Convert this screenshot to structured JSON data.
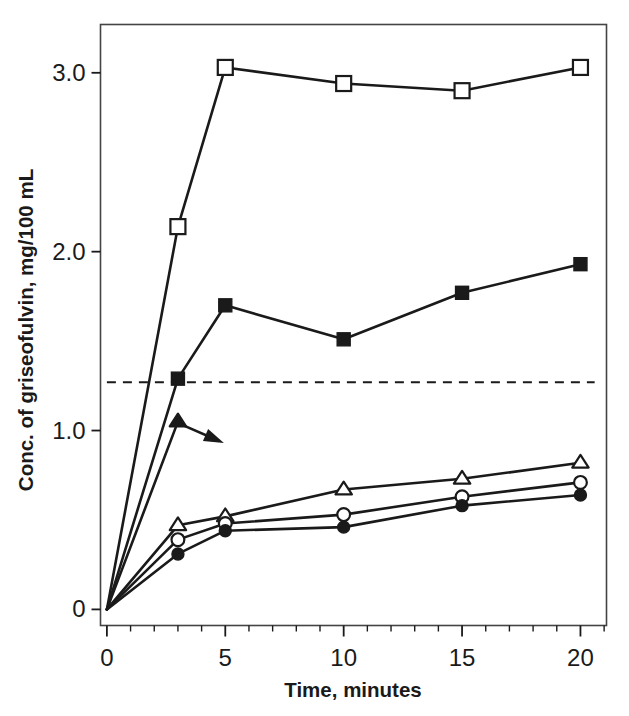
{
  "chart_data": {
    "type": "line",
    "title": "",
    "xlabel": "Time, minutes",
    "ylabel": "Conc. of griseofulvin, mg/100 mL",
    "x": [
      0,
      3,
      5,
      10,
      15,
      20
    ],
    "xlim": [
      -0.27,
      21.1
    ],
    "ylim": [
      -0.09,
      3.27
    ],
    "xticks": [
      0,
      5,
      10,
      15,
      20
    ],
    "xticklabels": [
      "0",
      "5",
      "10",
      "15",
      "20"
    ],
    "xminorticks": [
      1,
      2,
      3,
      4,
      6,
      7,
      8,
      9,
      11,
      12,
      13,
      14,
      16,
      17,
      18,
      19,
      21
    ],
    "yticks": [
      0,
      1.0,
      2.0,
      3.0
    ],
    "yticklabels": [
      "0",
      "1.0",
      "2.0",
      "3.0"
    ],
    "grid": false,
    "legend": "none",
    "frame": "box",
    "line_color": "#1a1a1a",
    "annotations": [
      {
        "kind": "arrow",
        "name": "triangle-series-arrow",
        "from_x": 3.0,
        "from_y": 1.05,
        "to_x": 5.0,
        "to_y": 0.93
      },
      {
        "kind": "dashed-horizontal-line",
        "name": "saturation-reference-line",
        "y": 1.27,
        "x_start": 0.0,
        "x_end": 20.6,
        "style": "dashed"
      }
    ],
    "series": [
      {
        "name": "open-square-series",
        "marker": "open-square",
        "x": [
          0,
          3,
          5,
          10,
          15,
          20
        ],
        "values": [
          0.0,
          2.14,
          3.03,
          2.94,
          2.9,
          3.03
        ]
      },
      {
        "name": "filled-square-series",
        "marker": "filled-square",
        "x": [
          0,
          3,
          5,
          10,
          15,
          20
        ],
        "values": [
          0.0,
          1.29,
          1.7,
          1.51,
          1.77,
          1.93
        ]
      },
      {
        "name": "filled-triangle-series",
        "marker": "filled-triangle",
        "x": [
          0,
          3
        ],
        "values": [
          0.0,
          1.05
        ]
      },
      {
        "name": "open-triangle-series",
        "marker": "open-triangle",
        "x": [
          0,
          3,
          5,
          10,
          15,
          20
        ],
        "values": [
          0.0,
          0.47,
          0.52,
          0.67,
          0.73,
          0.82
        ]
      },
      {
        "name": "open-circle-series",
        "marker": "open-circle",
        "x": [
          0,
          3,
          5,
          10,
          15,
          20
        ],
        "values": [
          0.0,
          0.39,
          0.48,
          0.53,
          0.63,
          0.71
        ]
      },
      {
        "name": "filled-circle-series",
        "marker": "filled-circle",
        "x": [
          0,
          3,
          5,
          10,
          15,
          20
        ],
        "values": [
          0.0,
          0.31,
          0.44,
          0.46,
          0.58,
          0.64
        ]
      }
    ]
  }
}
